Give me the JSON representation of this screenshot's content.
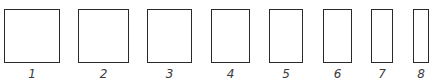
{
  "figure": {
    "stroke_color": "#2a2a2a",
    "label_color": "#3a3a3a",
    "shapes": [
      {
        "label": "1",
        "x": 4,
        "y": 9,
        "w": 56,
        "h": 54
      },
      {
        "label": "2",
        "x": 78,
        "y": 9,
        "w": 51,
        "h": 54
      },
      {
        "label": "3",
        "x": 147,
        "y": 9,
        "w": 45,
        "h": 54
      },
      {
        "label": "4",
        "x": 211,
        "y": 9,
        "w": 39,
        "h": 54
      },
      {
        "label": "5",
        "x": 269,
        "y": 9,
        "w": 34,
        "h": 54
      },
      {
        "label": "6",
        "x": 323,
        "y": 9,
        "w": 29,
        "h": 54
      },
      {
        "label": "7",
        "x": 371,
        "y": 9,
        "w": 22,
        "h": 54
      },
      {
        "label": "8",
        "x": 413,
        "y": 9,
        "w": 16,
        "h": 54
      }
    ]
  }
}
